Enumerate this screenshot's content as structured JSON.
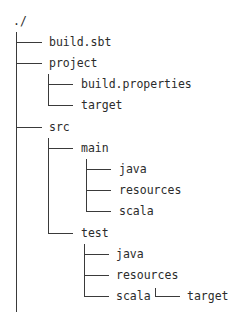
{
  "tree": {
    "root": "./",
    "nodes": [
      {
        "id": "build-sbt",
        "label": "build.sbt",
        "depth": 1
      },
      {
        "id": "project",
        "label": "project",
        "depth": 1
      },
      {
        "id": "project-build-properties",
        "label": "build.properties",
        "depth": 2
      },
      {
        "id": "project-target",
        "label": "target",
        "depth": 2
      },
      {
        "id": "src",
        "label": "src",
        "depth": 1
      },
      {
        "id": "src-main",
        "label": "main",
        "depth": 2
      },
      {
        "id": "src-main-java",
        "label": "java",
        "depth": 3
      },
      {
        "id": "src-main-resources",
        "label": "resources",
        "depth": 3
      },
      {
        "id": "src-main-scala",
        "label": "scala",
        "depth": 3
      },
      {
        "id": "src-test",
        "label": "test",
        "depth": 2
      },
      {
        "id": "src-test-java",
        "label": "java",
        "depth": 3
      },
      {
        "id": "src-test-resources",
        "label": "resources",
        "depth": 3
      },
      {
        "id": "src-test-scala",
        "label": "scala",
        "depth": 3
      },
      {
        "id": "target",
        "label": "target",
        "depth": 1
      }
    ]
  }
}
